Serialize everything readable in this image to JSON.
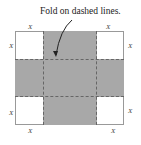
{
  "caption": "Fold on dashed lines.",
  "labels": {
    "x": "X"
  },
  "colors": {
    "fill": "#a8a8a8",
    "border": "#999999"
  }
}
